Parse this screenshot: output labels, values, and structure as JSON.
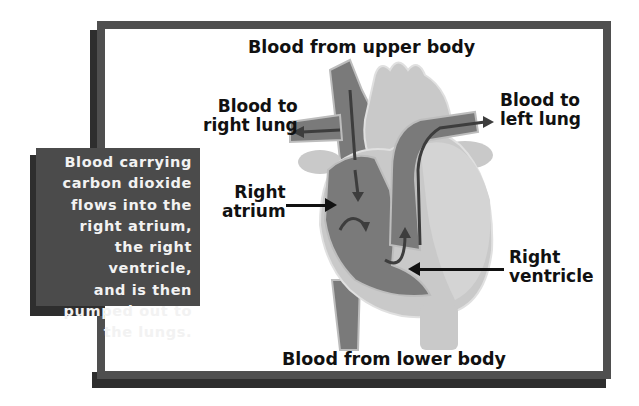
{
  "diagram": {
    "type": "heart-blood-flow",
    "caption": {
      "lines": [
        "Blood carrying",
        "carbon dioxide",
        "flows into the",
        "right atrium,",
        "the right",
        "ventricle,",
        "and is then",
        "pumped out to",
        "the lungs."
      ]
    },
    "labels": {
      "upper_body": "Blood from upper body",
      "right_lung": [
        "Blood to",
        "right lung"
      ],
      "left_lung": [
        "Blood to",
        "left lung"
      ],
      "right_atrium": [
        "Right",
        "atrium"
      ],
      "right_ventricle": [
        "Right",
        "ventricle"
      ],
      "lower_body": "Blood from lower body"
    },
    "colors": {
      "frame": "#4f4f4f",
      "shadow": "#2e2e2e",
      "caption_bg": "#4b4b4b",
      "heart_light": "#c9c9c9",
      "heart_dark": "#7a7a7a",
      "arrow": "#111111"
    }
  }
}
